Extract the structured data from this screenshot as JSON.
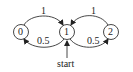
{
  "diagram": {
    "type": "state-transition",
    "nodes": [
      {
        "id": "0",
        "label": "0",
        "cx": 21,
        "cy": 32
      },
      {
        "id": "1",
        "label": "1",
        "cx": 67,
        "cy": 32
      },
      {
        "id": "2",
        "label": "2",
        "cx": 111,
        "cy": 32
      }
    ],
    "edges": [
      {
        "from": "0",
        "to": "1",
        "label": "1"
      },
      {
        "from": "2",
        "to": "1",
        "label": "1"
      },
      {
        "from": "1",
        "to": "0",
        "label": "0.5"
      },
      {
        "from": "1",
        "to": "2",
        "label": "0.5"
      }
    ],
    "start": {
      "label": "start",
      "node": "1"
    }
  }
}
